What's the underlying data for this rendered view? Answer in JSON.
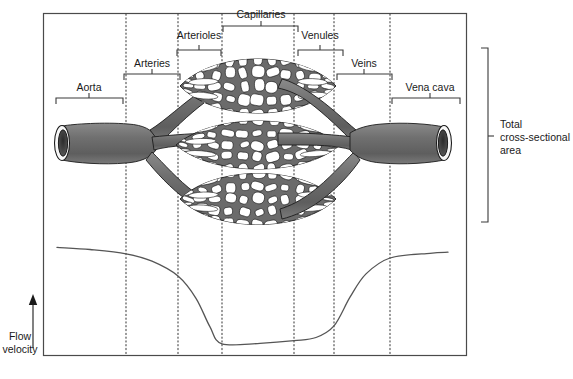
{
  "figure": {
    "title_present": false,
    "frame": {
      "x": 43,
      "y": 13,
      "width": 423,
      "height": 342,
      "stroke": "#4a4a4a"
    },
    "vessel_color": "#6b6b6b",
    "vessel_outline": "#1c1c1c",
    "curve_color": "#555555",
    "dotted_color": "#444444"
  },
  "top_labels": [
    {
      "name": "aorta",
      "text": "Aorta",
      "label_x": 89,
      "label_y": 91,
      "bracket_left": 56,
      "bracket_right": 123,
      "bracket_y": 98,
      "tick_x": 89
    },
    {
      "name": "arteries",
      "text": "Arteries",
      "label_x": 152,
      "label_y": 67,
      "bracket_left": 124,
      "bracket_right": 180,
      "bracket_y": 74,
      "tick_x": 152
    },
    {
      "name": "arterioles",
      "text": "Arterioles",
      "label_x": 199,
      "label_y": 39,
      "bracket_left": 177,
      "bracket_right": 221,
      "bracket_y": 50,
      "tick_x": 199
    },
    {
      "name": "capillaries",
      "text": "Capillaries",
      "label_x": 261,
      "label_y": 18,
      "bracket_left": 223,
      "bracket_right": 298,
      "bracket_y": 26,
      "tick_x": 261
    },
    {
      "name": "venules",
      "text": "Venules",
      "label_x": 320,
      "label_y": 39,
      "bracket_left": 298,
      "bracket_right": 343,
      "bracket_y": 50,
      "tick_x": 320
    },
    {
      "name": "veins",
      "text": "Veins",
      "label_x": 364,
      "label_y": 67,
      "bracket_left": 337,
      "bracket_right": 392,
      "bracket_y": 74,
      "tick_x": 364
    },
    {
      "name": "vena-cava",
      "text": "Vena cava",
      "label_x": 430,
      "label_y": 91,
      "bracket_left": 392,
      "bracket_right": 460,
      "bracket_y": 98,
      "tick_x": 430
    }
  ],
  "right_bracket": {
    "name": "total-cross-sectional-area",
    "lines": [
      "Total",
      "cross-sectional",
      "area"
    ],
    "x": 488,
    "top": 48,
    "bottom": 222,
    "tick_y": 136,
    "label_x": 500
  },
  "y_axis": {
    "name": "flow-velocity",
    "lines": [
      "Flow",
      "velocity"
    ],
    "label_x": 20,
    "label_y": 340,
    "arrow_x": 33,
    "arrow_top": 294,
    "arrow_bottom": 348
  },
  "dotted_lines": {
    "x_positions": [
      126,
      178,
      222,
      294,
      334,
      390
    ],
    "top": 14,
    "bottom": 354
  },
  "chart_data": {
    "type": "line",
    "xlabel": "",
    "ylabel": "Flow velocity",
    "grid": false,
    "legend": null,
    "x_segments": [
      "Aorta",
      "Arteries",
      "Arterioles",
      "Capillaries",
      "Venules",
      "Veins",
      "Vena cava"
    ],
    "series": [
      {
        "name": "Flow velocity",
        "points": [
          {
            "x": 57,
            "y": 0.93
          },
          {
            "x": 90,
            "y": 0.91
          },
          {
            "x": 126,
            "y": 0.87
          },
          {
            "x": 152,
            "y": 0.8
          },
          {
            "x": 178,
            "y": 0.66
          },
          {
            "x": 196,
            "y": 0.45
          },
          {
            "x": 210,
            "y": 0.18
          },
          {
            "x": 222,
            "y": 0.02
          },
          {
            "x": 260,
            "y": 0.025
          },
          {
            "x": 294,
            "y": 0.05
          },
          {
            "x": 316,
            "y": 0.08
          },
          {
            "x": 334,
            "y": 0.19
          },
          {
            "x": 350,
            "y": 0.46
          },
          {
            "x": 366,
            "y": 0.68
          },
          {
            "x": 390,
            "y": 0.83
          },
          {
            "x": 430,
            "y": 0.875
          },
          {
            "x": 448,
            "y": 0.885
          }
        ]
      }
    ]
  }
}
